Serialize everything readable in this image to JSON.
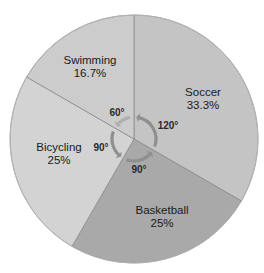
{
  "chart_data": {
    "type": "pie",
    "title": "",
    "start_angle_deg": 0,
    "direction": "clockwise",
    "slices": [
      {
        "label": "Soccer",
        "percent_label": "33.3%",
        "value": 33.3,
        "angle_deg": 120,
        "angle_label": "120°",
        "color": "#c4c4c4"
      },
      {
        "label": "Basketball",
        "percent_label": "25%",
        "value": 25,
        "angle_deg": 90,
        "angle_label": "90°",
        "color": "#a9a9a9"
      },
      {
        "label": "Bicycling",
        "percent_label": "25%",
        "value": 25,
        "angle_deg": 90,
        "angle_label": "90°",
        "color": "#d3d3d3"
      },
      {
        "label": "Swimming",
        "percent_label": "16.7%",
        "value": 16.7,
        "angle_deg": 60,
        "angle_label": "60°",
        "color": "#cccccc"
      }
    ],
    "annotations": [
      "Curved arrows around the center indicating each slice's central angle"
    ],
    "legend": "none (labels placed inside slices)"
  },
  "style": {
    "border_color": "#8a8a8a",
    "arrow_color": "#8f8f8f",
    "arrow_color_light": "#b0b0b0"
  }
}
